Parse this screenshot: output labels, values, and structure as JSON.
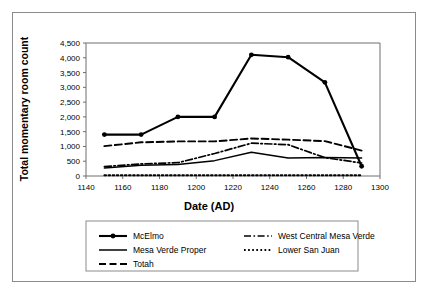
{
  "chart_data": {
    "type": "line",
    "title": "",
    "xlabel": "Date (AD)",
    "ylabel": "Total momentary room count",
    "xlim": [
      1140,
      1300
    ],
    "ylim": [
      0,
      4500
    ],
    "xticks": [
      1140,
      1160,
      1180,
      1200,
      1220,
      1240,
      1260,
      1280,
      1300
    ],
    "xticklabels": [
      "1140",
      "1160",
      "1180",
      "1200",
      "1220",
      "1240",
      "1260",
      "1280",
      "1300"
    ],
    "yticks": [
      0,
      500,
      1000,
      1500,
      2000,
      2500,
      3000,
      3500,
      4000,
      4500
    ],
    "yticklabels": [
      "0",
      "500",
      "1,000",
      "1,500",
      "2,000",
      "2,500",
      "3,000",
      "3,500",
      "4,000",
      "4,500"
    ],
    "grid": false,
    "legend_position": "bottom",
    "x": [
      1150,
      1170,
      1190,
      1210,
      1230,
      1250,
      1270,
      1290
    ],
    "series": [
      {
        "name": "McElmo",
        "style": "solid-marker",
        "marker": "circle",
        "values": [
          1400,
          1400,
          2000,
          2000,
          4100,
          4020,
          3170,
          330
        ]
      },
      {
        "name": "Mesa Verde Proper",
        "style": "solid",
        "marker": "none",
        "values": [
          270,
          360,
          390,
          520,
          800,
          610,
          630,
          610
        ]
      },
      {
        "name": "Totah",
        "style": "dashed",
        "marker": "none",
        "values": [
          1010,
          1140,
          1170,
          1170,
          1270,
          1230,
          1180,
          860
        ]
      },
      {
        "name": "West Central Mesa Verde",
        "style": "dash-dot",
        "marker": "none",
        "values": [
          320,
          410,
          450,
          760,
          1110,
          1060,
          620,
          440
        ]
      },
      {
        "name": "Lower San Juan",
        "style": "dotted",
        "marker": "none",
        "values": [
          25,
          25,
          25,
          25,
          25,
          25,
          25,
          25
        ]
      }
    ]
  },
  "colors": {
    "line": "#000000",
    "axis": "#6e6e6e",
    "frame": "#8b8b8b",
    "background": "#ffffff"
  },
  "legend": {
    "entries": [
      {
        "label": "McElmo",
        "style": "solid-marker"
      },
      {
        "label": "West Central Mesa Verde",
        "style": "dash-dot"
      },
      {
        "label": "Mesa Verde Proper",
        "style": "solid"
      },
      {
        "label": "Lower San Juan",
        "style": "dotted"
      },
      {
        "label": "Totah",
        "style": "dashed"
      }
    ]
  }
}
